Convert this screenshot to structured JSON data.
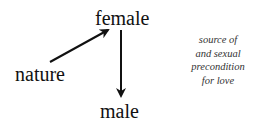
{
  "nodes": {
    "female": "female",
    "nature": "nature",
    "male": "male"
  },
  "edges": [
    {
      "from": "nature",
      "to": "female"
    },
    {
      "from": "female",
      "to": "male"
    }
  ],
  "note": {
    "lines": [
      "source of",
      "and sexual",
      "precondition",
      "for love"
    ]
  }
}
